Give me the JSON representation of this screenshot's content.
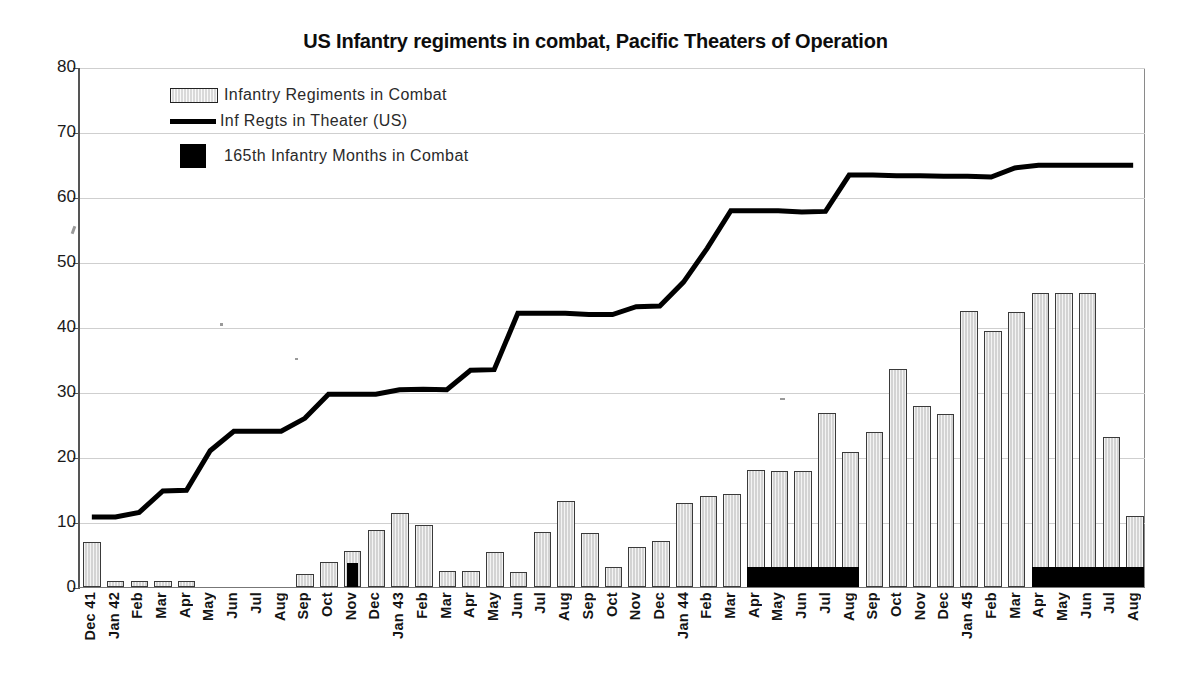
{
  "chart_data": {
    "type": "bar",
    "title": "US Infantry regiments in combat, Pacific Theaters of Operation",
    "xlabel": "",
    "ylabel": "",
    "ylim": [
      0,
      80
    ],
    "yticks": [
      0,
      10,
      20,
      30,
      40,
      50,
      60,
      70,
      80
    ],
    "grid": true,
    "legend_position": "top-left",
    "categories": [
      "Dec 41",
      "Jan 42",
      "Feb",
      "Mar",
      "Apr",
      "May",
      "Jun",
      "Jul",
      "Aug",
      "Sep",
      "Oct",
      "Nov",
      "Dec",
      "Jan 43",
      "Feb",
      "Mar",
      "Apr",
      "May",
      "Jun",
      "Jul",
      "Aug",
      "Sep",
      "Oct",
      "Nov",
      "Dec",
      "Jan 44",
      "Feb",
      "Mar",
      "Apr",
      "May",
      "Jun",
      "Jul",
      "Aug",
      "Sep",
      "Oct",
      "Nov",
      "Dec",
      "Jan 45",
      "Feb",
      "Mar",
      "Apr",
      "May",
      "Jun",
      "Jul",
      "Aug"
    ],
    "series": [
      {
        "name": "Infantry  Regiments in Combat",
        "type": "bar",
        "values": [
          7,
          1,
          1,
          1,
          1,
          0,
          0,
          0,
          0,
          2,
          3.8,
          5.5,
          8.7,
          11.4,
          9.5,
          2.4,
          2.4,
          5.4,
          2.3,
          8.4,
          13.2,
          8.3,
          3.1,
          6.1,
          7.1,
          12.9,
          14,
          14.3,
          18,
          17.8,
          17.9,
          26.8,
          20.8,
          23.8,
          33.5,
          27.8,
          26.6,
          42.5,
          39.4,
          42.3,
          45.3,
          45.3,
          45.2,
          23.1,
          11
        ]
      },
      {
        "name": "Inf Regts in Theater (US)",
        "type": "line",
        "values": [
          10.8,
          10.8,
          11.5,
          14.8,
          14.9,
          21,
          24,
          24,
          24,
          26,
          29.7,
          29.7,
          29.7,
          30.4,
          30.5,
          30.4,
          33.4,
          33.5,
          42.2,
          42.2,
          42.2,
          42,
          42,
          43.2,
          43.3,
          47,
          52.2,
          58,
          58,
          58,
          57.8,
          57.9,
          63.5,
          63.5,
          63.4,
          63.4,
          63.3,
          63.3,
          63.2,
          64.6,
          65,
          65,
          65,
          65,
          65
        ]
      },
      {
        "name": "165th Infantry Months in Combat",
        "type": "marker-block",
        "blocks": [
          {
            "start": "Nov",
            "start_index": 11,
            "end_index": 11,
            "label": "Nov 42"
          },
          {
            "start": "Apr",
            "start_index": 28,
            "end_index": 32,
            "label": "Apr 44 - Aug 44"
          },
          {
            "start": "Apr",
            "start_index": 40,
            "end_index": 44,
            "label": "Apr 45 - Aug 45"
          }
        ]
      }
    ],
    "colors": {
      "bar_fill": "#d3d3d3",
      "bar_stroke": "#3a3a3a",
      "line": "#000000",
      "block": "#000000",
      "grid": "#cfcfcf",
      "text": "#141414"
    }
  },
  "legend": {
    "items": [
      {
        "label": "Infantry  Regiments in Combat",
        "swatch": "bar-swatch-icon"
      },
      {
        "label": "Inf Regts in Theater (US)",
        "swatch": "line-swatch-icon"
      },
      {
        "label": "165th Infantry Months in Combat",
        "swatch": "block-swatch-icon"
      }
    ]
  }
}
